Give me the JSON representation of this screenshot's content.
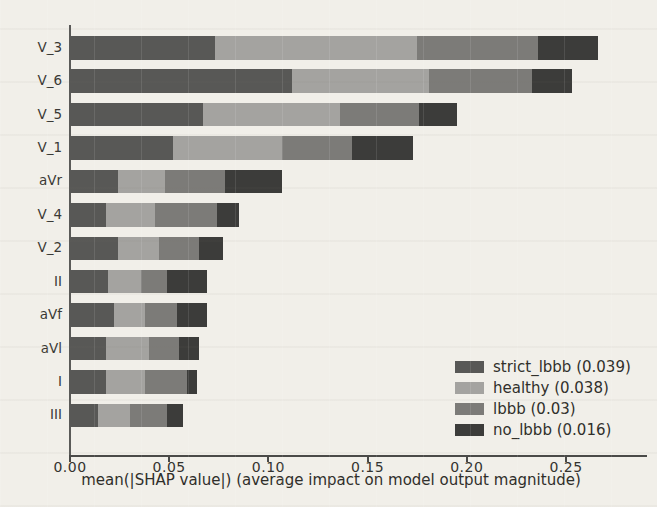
{
  "chart_data": {
    "type": "bar",
    "orientation": "horizontal",
    "stacked": true,
    "title": "",
    "xlabel": "mean(|SHAP value|) (average impact on model output magnitude)",
    "ylabel": "",
    "categories": [
      "V_3",
      "V_6",
      "V_5",
      "V_1",
      "aVr",
      "V_4",
      "V_2",
      "II",
      "aVf",
      "aVl",
      "I",
      "III"
    ],
    "series": [
      {
        "name": "strict_lbbb",
        "legend_label": "strict_lbbb (0.039)",
        "color": "#585856",
        "values": [
          0.073,
          0.112,
          0.067,
          0.052,
          0.024,
          0.018,
          0.024,
          0.019,
          0.022,
          0.018,
          0.018,
          0.014
        ]
      },
      {
        "name": "healthy",
        "legend_label": "healthy (0.038)",
        "color": "#a4a3a0",
        "values": [
          0.102,
          0.069,
          0.069,
          0.055,
          0.024,
          0.025,
          0.021,
          0.017,
          0.016,
          0.022,
          0.02,
          0.016
        ]
      },
      {
        "name": "lbbb",
        "legend_label": "lbbb (0.03)",
        "color": "#7c7b78",
        "values": [
          0.061,
          0.052,
          0.04,
          0.035,
          0.03,
          0.031,
          0.02,
          0.013,
          0.016,
          0.015,
          0.021,
          0.019
        ]
      },
      {
        "name": "no_lbbb",
        "legend_label": "no_lbbb (0.016)",
        "color": "#3c3c3a",
        "values": [
          0.03,
          0.02,
          0.019,
          0.031,
          0.029,
          0.011,
          0.012,
          0.02,
          0.015,
          0.01,
          0.005,
          0.008
        ]
      }
    ],
    "x_ticks": [
      0.0,
      0.05,
      0.1,
      0.15,
      0.2,
      0.25
    ],
    "x_tick_labels": [
      "0.00",
      "0.05",
      "0.10",
      "0.15",
      "0.20",
      "0.25"
    ],
    "xlim": [
      0,
      0.2915
    ],
    "grid": false,
    "legend_position": "lower right"
  }
}
